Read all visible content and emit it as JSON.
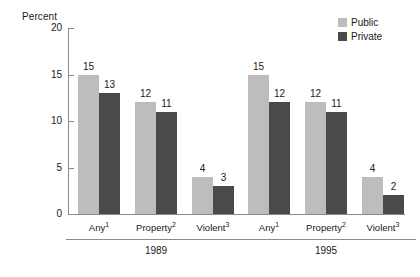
{
  "chart_data": {
    "type": "bar",
    "title": "",
    "subtitle": "",
    "xlabel": "",
    "ylabel": "Percent",
    "ylim": [
      0,
      20
    ],
    "yticks": [
      0,
      5,
      10,
      15,
      20
    ],
    "ytick_labels": [
      "0",
      "5",
      "10",
      "15",
      "20"
    ],
    "grid": false,
    "legend_position": "top-right",
    "legend": [
      "Public",
      "Private"
    ],
    "colors": {
      "public": "#bdbdbd",
      "private": "#4a4a4a",
      "axis": "#8a8a8a",
      "text": "#1a1a1a"
    },
    "groups": [
      {
        "name": "1989",
        "categories": [
          "Any",
          "Property",
          "Violent"
        ],
        "category_footnotes": [
          "1",
          "2",
          "3"
        ],
        "series": [
          {
            "name": "Public",
            "values": [
              15,
              12,
              4
            ]
          },
          {
            "name": "Private",
            "values": [
              13,
              11,
              3
            ]
          }
        ]
      },
      {
        "name": "1995",
        "categories": [
          "Any",
          "Property",
          "Violent"
        ],
        "category_footnotes": [
          "1",
          "2",
          "3"
        ],
        "series": [
          {
            "name": "Public",
            "values": [
              15,
              12,
              4
            ]
          },
          {
            "name": "Private",
            "values": [
              12,
              11,
              2
            ]
          }
        ]
      }
    ]
  },
  "axis": {
    "y_title": "Percent"
  },
  "legend": {
    "items": [
      {
        "label": "Public",
        "color": "#bdbdbd"
      },
      {
        "label": "Private",
        "color": "#4a4a4a"
      }
    ]
  }
}
